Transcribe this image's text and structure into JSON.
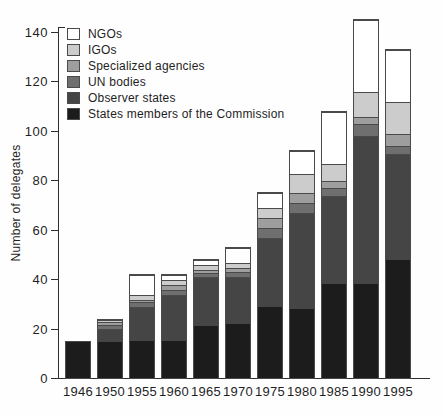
{
  "figure": {
    "title": "",
    "background": "#fefefe"
  },
  "legend": {
    "position": "upper-left",
    "items": [
      {
        "name": "ngos",
        "label": "NGOs",
        "color": "#ffffff"
      },
      {
        "name": "igos",
        "label": "IGOs",
        "color": "#cccccc"
      },
      {
        "name": "specialized-agencies",
        "label": "Specialized agencies",
        "color": "#9e9e9e"
      },
      {
        "name": "un-bodies",
        "label": "UN bodies",
        "color": "#6f6f6f"
      },
      {
        "name": "observer-states",
        "label": "Observer states",
        "color": "#454545"
      },
      {
        "name": "states-members",
        "label": "States members of the Commission",
        "color": "#1c1c1c"
      }
    ]
  },
  "chart_data": {
    "type": "bar",
    "stacked": true,
    "title": "",
    "xlabel": "",
    "ylabel": "Number of delegates",
    "ylim": [
      0,
      140
    ],
    "yticks": [
      0,
      20,
      40,
      60,
      80,
      100,
      120,
      140
    ],
    "grid": false,
    "bar_outline_color": "#4a4a4a",
    "categories": [
      "1946",
      "1950",
      "1955",
      "1960",
      "1965",
      "1970",
      "1975",
      "1980",
      "1985",
      "1990",
      "1995"
    ],
    "series": [
      {
        "name": "States members of the Commission",
        "color": "#1c1c1c",
        "values": [
          15,
          15,
          15,
          15,
          21,
          22,
          29,
          28,
          38,
          38,
          48
        ]
      },
      {
        "name": "Observer states",
        "color": "#454545",
        "values": [
          0,
          5,
          14,
          19,
          20,
          19,
          28,
          39,
          36,
          60,
          43
        ]
      },
      {
        "name": "UN bodies",
        "color": "#6f6f6f",
        "values": [
          0,
          2,
          2,
          2,
          2,
          2,
          4,
          4,
          3,
          5,
          3
        ]
      },
      {
        "name": "Specialized agencies",
        "color": "#9e9e9e",
        "values": [
          0,
          1,
          1,
          2,
          1,
          2,
          4,
          4,
          3,
          3,
          5
        ]
      },
      {
        "name": "IGOs",
        "color": "#cccccc",
        "values": [
          0,
          1,
          2,
          2,
          2,
          2,
          4,
          8,
          7,
          10,
          13
        ]
      },
      {
        "name": "NGOs",
        "color": "#ffffff",
        "values": [
          0,
          0,
          8,
          2,
          2,
          6,
          6,
          9,
          21,
          29,
          21
        ]
      }
    ],
    "totals": [
      15,
      24,
      42,
      42,
      48,
      53,
      75,
      92,
      108,
      145,
      133
    ]
  }
}
